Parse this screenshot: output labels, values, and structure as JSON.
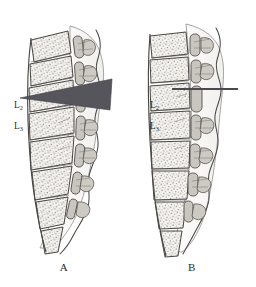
{
  "figure": {
    "background_color": "#ffffff",
    "ink_color": "#3a3a3a",
    "bone_fill": "#f2f1ef",
    "trabecular_color": "#8c8880",
    "process_fill": "#c9c6c0",
    "needle_color": "#55555b",
    "text_color": "#2b2b2b"
  },
  "panels": [
    {
      "id": "a",
      "caption": "A",
      "caption_x": 42,
      "caption_y": 262,
      "description": "Lordotic lumbar spine with wedge-shaped needle trajectory at the L2-L3 interspace",
      "needle": {
        "type": "wedge",
        "color": "#55555b",
        "apex_x": 20,
        "apex_y": 98,
        "base_top_x": 112,
        "base_top_y": 79,
        "base_bottom_x": 110,
        "base_bottom_y": 110
      },
      "levels": [
        {
          "label": "L",
          "sub": "2",
          "x": 14,
          "y": 106
        },
        {
          "label": "L",
          "sub": "3",
          "x": 14,
          "y": 127
        }
      ]
    },
    {
      "id": "b",
      "caption": "B",
      "caption_x": 201,
      "caption_y": 262,
      "description": "Straightened lumbar spine with thin horizontal needle at the L2-L3 interspace",
      "needle": {
        "type": "line",
        "color": "#4a4a50",
        "x1": 44,
        "y1": 89,
        "x2": 110,
        "y2": 89,
        "thickness": 2.2
      },
      "levels": [
        {
          "label": "L",
          "sub": "2",
          "x": 22,
          "y": 106
        },
        {
          "label": "L",
          "sub": "3",
          "x": 22,
          "y": 127
        }
      ]
    }
  ]
}
